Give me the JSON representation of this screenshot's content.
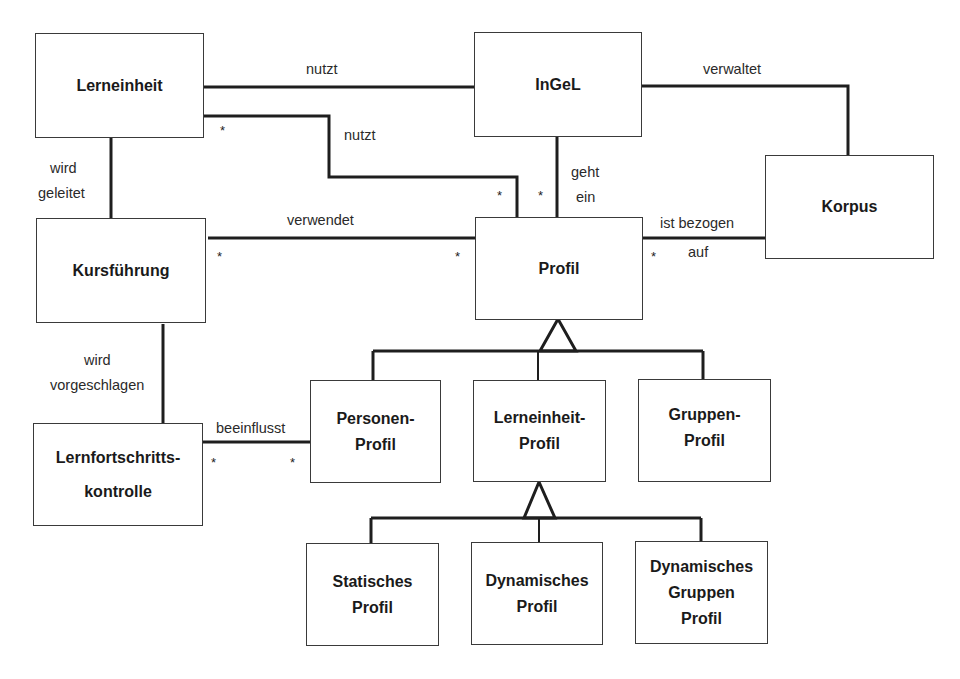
{
  "diagram": {
    "type": "uml-class-diagram",
    "classes": {
      "lerneinheit": {
        "lines": [
          "Lerneinheit"
        ]
      },
      "ingel": {
        "lines": [
          "InGeL"
        ]
      },
      "korpus": {
        "lines": [
          "Korpus"
        ]
      },
      "kursfuehrung": {
        "lines": [
          "Kursführung"
        ]
      },
      "profil": {
        "lines": [
          "Profil"
        ]
      },
      "lernfortschrittskontrolle": {
        "lines": [
          "Lernfortschritts-",
          "kontrolle"
        ]
      },
      "personen_profil": {
        "lines": [
          "Personen-",
          "Profil"
        ]
      },
      "lerneinheit_profil": {
        "lines": [
          "Lerneinheit-",
          "Profil"
        ]
      },
      "gruppen_profil": {
        "lines": [
          "Gruppen-",
          "Profil"
        ]
      },
      "statisches_profil": {
        "lines": [
          "Statisches",
          "Profil"
        ]
      },
      "dynamisches_profil": {
        "lines": [
          "Dynamisches",
          "Profil"
        ]
      },
      "dynamisches_gruppen_profil": {
        "lines": [
          "Dynamisches",
          "Gruppen",
          "Profil"
        ]
      }
    },
    "associations": {
      "lerneinheit_ingel": {
        "label": "nutzt"
      },
      "lerneinheit_profil": {
        "label": "nutzt",
        "multiplicity_source": "*",
        "multiplicity_target": "*"
      },
      "ingel_korpus": {
        "label": "verwaltet"
      },
      "ingel_profil": {
        "label_lines": [
          "geht",
          "ein"
        ],
        "multiplicity_target": "*"
      },
      "lerneinheit_kursfuehrung": {
        "label_lines": [
          "wird",
          "geleitet"
        ]
      },
      "kursfuehrung_profil": {
        "label": "verwendet",
        "multiplicity_source": "*",
        "multiplicity_target": "*"
      },
      "profil_korpus": {
        "label_lines": [
          "ist bezogen",
          "auf"
        ],
        "multiplicity_source": "*"
      },
      "kursfuehrung_lernfortschrittskontrolle": {
        "label_lines": [
          "wird",
          "vorgeschlagen"
        ]
      },
      "lernfortschrittskontrolle_personen_profil": {
        "label": "beeinflusst",
        "multiplicity_source": "*",
        "multiplicity_target": "*"
      }
    },
    "generalizations": [
      {
        "parent": "Profil",
        "children": [
          "Personen-Profil",
          "Lerneinheit-Profil",
          "Gruppen-Profil"
        ]
      },
      {
        "parent": "Lerneinheit-Profil",
        "children": [
          "Statisches Profil",
          "Dynamisches Profil",
          "Dynamisches Gruppen Profil"
        ]
      }
    ]
  }
}
